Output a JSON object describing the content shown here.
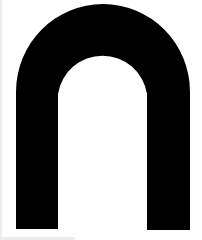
{
  "figure": {
    "shape": "arch",
    "colors": {
      "fill": "#000000",
      "background": "#ffffff"
    }
  }
}
